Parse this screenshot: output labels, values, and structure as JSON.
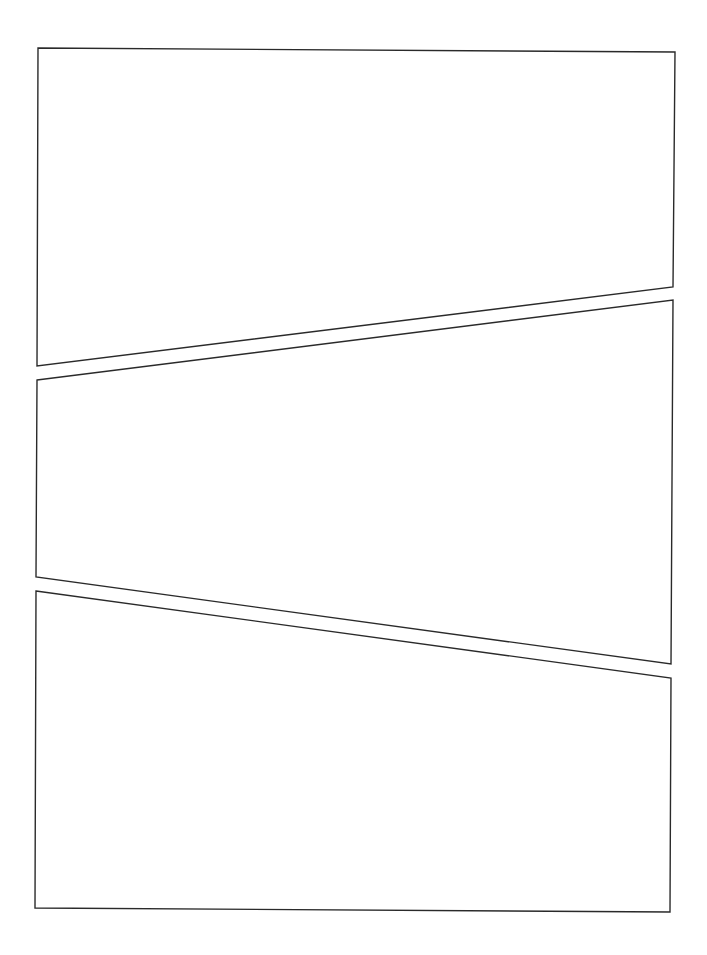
{
  "page": {
    "width": 707,
    "height": 955,
    "background": "#ffffff",
    "border_color": "#2a2a2a"
  },
  "panels": [
    {
      "id": "panel-1",
      "points": "38,48 675,52 673,287 37,366"
    },
    {
      "id": "panel-2",
      "points": "37,380 673,300 671,664 36,577"
    },
    {
      "id": "panel-3",
      "points": "36,591 671,678 670,912 35,908"
    }
  ]
}
